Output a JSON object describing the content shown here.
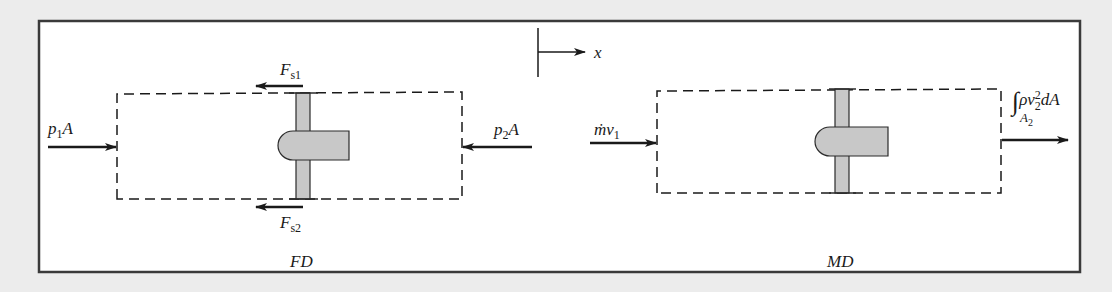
{
  "diagrams": {
    "left": {
      "caption": "FD",
      "labels": {
        "inlet_force": {
          "base": "p",
          "sub": "1",
          "tail": "A"
        },
        "outlet_force": {
          "base": "p",
          "sub": "2",
          "tail": "A"
        },
        "support_force_top": {
          "base": "F",
          "sub": "s1"
        },
        "support_force_bottom": {
          "base": "F",
          "sub": "s2"
        }
      }
    },
    "right": {
      "caption": "MD",
      "labels": {
        "inlet_momentum": {
          "base": "ṁv",
          "sub": "1"
        },
        "outlet_momentum": {
          "integral": "∫",
          "body": "ρv",
          "sup": "2",
          "sub": "2",
          "tail": "dA",
          "limit": "A",
          "limit_sub": "2"
        }
      }
    },
    "axis": {
      "label": "x"
    }
  },
  "colors": {
    "background": "#ececec",
    "panel": "#ffffff",
    "stroke": "#2a2a2a",
    "body_fill": "#c8c8c8"
  }
}
